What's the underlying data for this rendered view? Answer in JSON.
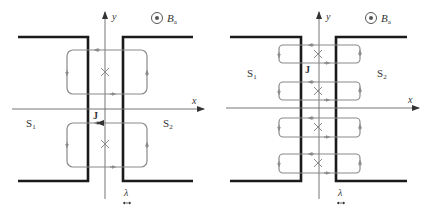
{
  "colors": {
    "electrode": "#1a1a1a",
    "axis": "#777777",
    "current_loop": "#8a8a8a",
    "text": "#333333"
  },
  "panels": [
    {
      "id": "left",
      "labels": {
        "y_axis": "y",
        "x_axis": "x",
        "field": "B",
        "field_sub": "a",
        "superconductor_1": "S",
        "s1_sub": "1",
        "superconductor_2": "S",
        "s2_sub": "2",
        "current": "J",
        "penetration_depth": "λ"
      },
      "vortex_count": 2,
      "icons": [
        "field-out-of-page-icon",
        "vortex-cross-icon"
      ]
    },
    {
      "id": "right",
      "labels": {
        "y_axis": "y",
        "x_axis": "x",
        "field": "B",
        "field_sub": "a",
        "superconductor_1": "S",
        "s1_sub": "1",
        "superconductor_2": "S",
        "s2_sub": "2",
        "current": "J",
        "penetration_depth": "λ"
      },
      "vortex_count": 4,
      "icons": [
        "field-out-of-page-icon",
        "vortex-cross-icon"
      ]
    }
  ]
}
